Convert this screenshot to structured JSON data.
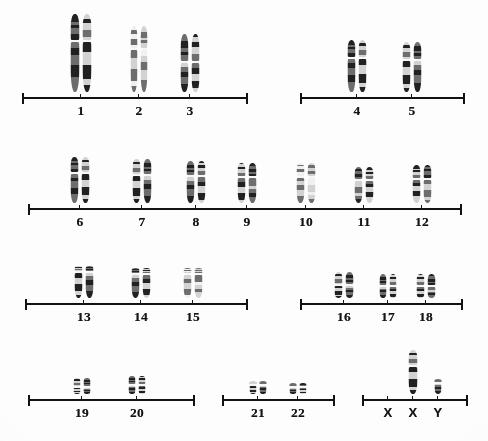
{
  "figure": {
    "name": "human-karyotype",
    "background_color": "#fdfdfc",
    "ink_color": "#121212",
    "band_dark": "#2b2b2b",
    "band_mid": "#6f6f6f",
    "band_light": "#c9c9c9"
  },
  "rows": [
    {
      "row_id": "row-1",
      "axes": [
        {
          "axis_id": "axis-1-7",
          "x_start": 22,
          "x_end": 246,
          "y": 97,
          "groups": [
            {
              "label": "1",
              "tick_x": 81,
              "count": 2,
              "height": 78,
              "width": 9,
              "shape": "submetacentric-bent"
            },
            {
              "label": "2",
              "tick_x": 139,
              "count": 2,
              "height": 66,
              "width": 7,
              "shape": "submetacentric-pale"
            },
            {
              "label": "3",
              "tick_x": 190,
              "count": 2,
              "height": 58,
              "width": 8,
              "shape": "metacentric"
            }
          ]
        },
        {
          "axis_id": "axis-4-5",
          "x_start": 300,
          "x_end": 463,
          "y": 97,
          "groups": [
            {
              "label": "4",
              "tick_x": 357,
              "count": 2,
              "height": 52,
              "width": 8,
              "shape": "submetacentric"
            },
            {
              "label": "5",
              "tick_x": 412,
              "count": 2,
              "height": 50,
              "width": 8,
              "shape": "submetacentric"
            }
          ]
        }
      ]
    },
    {
      "row_id": "row-2",
      "axes": [
        {
          "axis_id": "axis-6-12",
          "x_start": 28,
          "x_end": 460,
          "y": 208,
          "groups": [
            {
              "label": "6",
              "tick_x": 80,
              "count": 2,
              "height": 46,
              "width": 8,
              "shape": "submetacentric"
            },
            {
              "label": "7",
              "tick_x": 142,
              "count": 2,
              "height": 44,
              "width": 8,
              "shape": "submetacentric"
            },
            {
              "label": "8",
              "tick_x": 196,
              "count": 2,
              "height": 42,
              "width": 8,
              "shape": "submetacentric"
            },
            {
              "label": "9",
              "tick_x": 247,
              "count": 2,
              "height": 40,
              "width": 8,
              "shape": "submetacentric"
            },
            {
              "label": "10",
              "tick_x": 306,
              "count": 2,
              "height": 40,
              "width": 8,
              "shape": "submetacentric-pale"
            },
            {
              "label": "11",
              "tick_x": 364,
              "count": 2,
              "height": 36,
              "width": 8,
              "shape": "submetacentric"
            },
            {
              "label": "12",
              "tick_x": 422,
              "count": 2,
              "height": 38,
              "width": 8,
              "shape": "submetacentric"
            }
          ]
        }
      ]
    },
    {
      "row_id": "row-3",
      "axes": [
        {
          "axis_id": "axis-13-15",
          "x_start": 25,
          "x_end": 246,
          "y": 303,
          "groups": [
            {
              "label": "13",
              "tick_x": 84,
              "count": 2,
              "height": 32,
              "width": 8,
              "shape": "acrocentric"
            },
            {
              "label": "14",
              "tick_x": 141,
              "count": 2,
              "height": 30,
              "width": 8,
              "shape": "acrocentric"
            },
            {
              "label": "15",
              "tick_x": 193,
              "count": 2,
              "height": 30,
              "width": 8,
              "shape": "acrocentric-pale"
            }
          ]
        },
        {
          "axis_id": "axis-16-18",
          "x_start": 300,
          "x_end": 461,
          "y": 303,
          "groups": [
            {
              "label": "16",
              "tick_x": 344,
              "count": 2,
              "height": 26,
              "width": 8,
              "shape": "metacentric"
            },
            {
              "label": "17",
              "tick_x": 388,
              "count": 2,
              "height": 24,
              "width": 7,
              "shape": "metacentric"
            },
            {
              "label": "18",
              "tick_x": 426,
              "count": 2,
              "height": 24,
              "width": 8,
              "shape": "metacentric"
            }
          ]
        }
      ]
    },
    {
      "row_id": "row-4",
      "axes": [
        {
          "axis_id": "axis-19-20",
          "x_start": 28,
          "x_end": 193,
          "y": 399,
          "groups": [
            {
              "label": "19",
              "tick_x": 82,
              "count": 2,
              "height": 16,
              "width": 7,
              "shape": "metacentric-small"
            },
            {
              "label": "20",
              "tick_x": 137,
              "count": 2,
              "height": 18,
              "width": 7,
              "shape": "metacentric-small"
            }
          ]
        },
        {
          "axis_id": "axis-21-22",
          "x_start": 222,
          "x_end": 333,
          "y": 399,
          "groups": [
            {
              "label": "21",
              "tick_x": 258,
              "count": 2,
              "height": 13,
              "width": 7,
              "shape": "acrocentric-small"
            },
            {
              "label": "22",
              "tick_x": 298,
              "count": 2,
              "height": 11,
              "width": 7,
              "shape": "acrocentric-small"
            }
          ]
        },
        {
          "axis_id": "axis-sex",
          "x_start": 362,
          "x_end": 466,
          "y": 399,
          "groups": [
            {
              "label": "X",
              "tick_x": 388,
              "count": 0,
              "height": 0,
              "width": 0,
              "shape": "empty"
            },
            {
              "label": "X",
              "tick_x": 413,
              "count": 1,
              "height": 44,
              "width": 9,
              "shape": "submetacentric"
            },
            {
              "label": "Y",
              "tick_x": 438,
              "count": 1,
              "height": 15,
              "width": 7,
              "shape": "acrocentric-small"
            }
          ]
        }
      ]
    }
  ]
}
